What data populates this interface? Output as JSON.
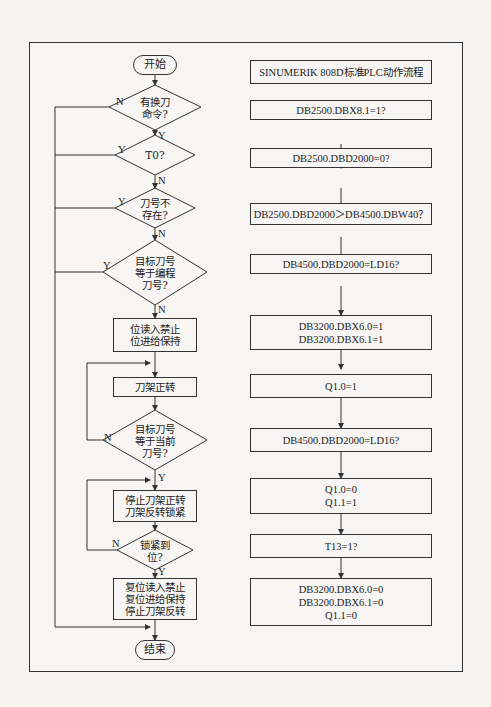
{
  "left_flow": {
    "start": "开始",
    "end": "结束",
    "decisions": [
      {
        "id": "d1",
        "lines": [
          "有换刀",
          "命令?"
        ],
        "yes": "Y",
        "no": "N"
      },
      {
        "id": "d2",
        "lines": [
          "T0?"
        ],
        "yes": "Y",
        "no": "N"
      },
      {
        "id": "d3",
        "lines": [
          "刀号不",
          "存在?"
        ],
        "yes": "Y",
        "no": "N"
      },
      {
        "id": "d4",
        "lines": [
          "目标刀号",
          "等于编程",
          "刀号?"
        ],
        "yes": "Y",
        "no": "N"
      },
      {
        "id": "d5",
        "lines": [
          "目标刀号",
          "等于当前",
          "刀号?"
        ],
        "yes": "Y",
        "no": "N"
      },
      {
        "id": "d6",
        "lines": [
          "锁紧到",
          "位?"
        ],
        "yes": "Y",
        "no": "N"
      }
    ],
    "processes": [
      {
        "id": "p1",
        "lines": [
          "位读入禁止",
          "位进给保持"
        ]
      },
      {
        "id": "p2",
        "lines": [
          "刀架正转"
        ]
      },
      {
        "id": "p3",
        "lines": [
          "停止刀架正转",
          "刀架反转锁紧"
        ]
      },
      {
        "id": "p4",
        "lines": [
          "复位读入禁止",
          "复位进给保持",
          "停止刀架反转"
        ]
      }
    ]
  },
  "right_flow": {
    "title": "SINUMERIK 808D标准PLC动作流程",
    "steps": [
      {
        "lines": [
          "DB2500.DBX8.1=1?"
        ]
      },
      {
        "lines": [
          "DB2500.DBD2000=0?"
        ]
      },
      {
        "lines": [
          "DB2500.DBD2000＞DB4500.DBW40？"
        ]
      },
      {
        "lines": [
          "DB4500.DBD2000=LD16?"
        ]
      },
      {
        "lines": [
          "DB3200.DBX6.0=1",
          "DB3200.DBX6.1=1"
        ]
      },
      {
        "lines": [
          "Q1.0=1"
        ]
      },
      {
        "lines": [
          "DB4500.DBD2000=LD16?"
        ]
      },
      {
        "lines": [
          "Q1.0=0",
          "Q1.1=1"
        ]
      },
      {
        "lines": [
          "T13=1?"
        ]
      },
      {
        "lines": [
          "DB3200.DBX6.0=0",
          "DB3200.DBX6.1=0",
          "Q1.1=0"
        ]
      }
    ]
  },
  "colors": {
    "line": "#333333",
    "background": "#f4f3f1"
  }
}
